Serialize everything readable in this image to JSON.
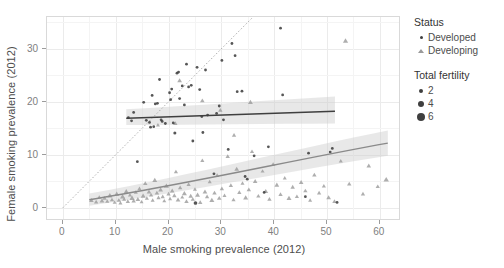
{
  "chart": {
    "type": "scatter",
    "title": "",
    "xlabel": "Male smoking prevalence (2012)",
    "ylabel": "Female smoking prevalence (2012)",
    "xlim": [
      -3,
      64
    ],
    "ylim": [
      -2.5,
      36
    ],
    "xticks": [
      0,
      10,
      20,
      30,
      40,
      50,
      60
    ],
    "yticks": [
      0,
      10,
      20,
      30
    ],
    "grid": true,
    "grid_color": "#ebebeb",
    "panel_bg": "#ffffff",
    "reference_line": {
      "name": "identity-line",
      "style": "dotted",
      "from": [
        0,
        0
      ],
      "to": [
        36,
        36
      ],
      "color": "#999999"
    }
  },
  "legend": {
    "position": "right",
    "status": {
      "title": "Status",
      "items": [
        {
          "label": "Developed",
          "color": "#3f3f3f",
          "shape": "circle"
        },
        {
          "label": "Developing",
          "color": "#9a9a9a",
          "shape": "triangle"
        }
      ]
    },
    "fertility": {
      "title": "Total fertility",
      "items": [
        {
          "label": "2",
          "size": 4
        },
        {
          "label": "4",
          "size": 6
        },
        {
          "label": "6",
          "size": 8
        }
      ]
    }
  },
  "chart_data": {
    "type": "scatter",
    "title": "",
    "xlabel": "Male smoking prevalence (2012)",
    "ylabel": "Female smoking prevalence (2012)",
    "xlim": [
      -3,
      64
    ],
    "ylim": [
      -2.5,
      36
    ],
    "xticks": [
      0,
      10,
      20,
      30,
      40,
      50,
      60
    ],
    "yticks": [
      0,
      10,
      20,
      30
    ],
    "grid": true,
    "legend_position": "right",
    "size_encoding": {
      "name": "Total fertility",
      "breaks": [
        2,
        4,
        6
      ]
    },
    "color_encoding": {
      "name": "Status",
      "levels": [
        "Developed",
        "Developing"
      ]
    },
    "series": [
      {
        "name": "Developed",
        "shape": "circle",
        "color": "#3f3f3f",
        "points": [
          {
            "x": 12.4,
            "y": 17.0,
            "s": 2.0
          },
          {
            "x": 13.0,
            "y": 16.4,
            "s": 2.0
          },
          {
            "x": 13.4,
            "y": 18.0,
            "s": 2.0
          },
          {
            "x": 14.1,
            "y": 8.7,
            "s": 2.0
          },
          {
            "x": 15.3,
            "y": 19.9,
            "s": 2.0
          },
          {
            "x": 15.8,
            "y": 16.5,
            "s": 2.2
          },
          {
            "x": 16.4,
            "y": 16.1,
            "s": 2.0
          },
          {
            "x": 16.6,
            "y": 15.2,
            "s": 2.0
          },
          {
            "x": 16.9,
            "y": 21.2,
            "s": 2.0
          },
          {
            "x": 17.2,
            "y": 15.3,
            "s": 2.0
          },
          {
            "x": 17.5,
            "y": 19.6,
            "s": 2.4
          },
          {
            "x": 17.9,
            "y": 19.7,
            "s": 2.4
          },
          {
            "x": 18.3,
            "y": 24.2,
            "s": 2.0
          },
          {
            "x": 18.6,
            "y": 16.6,
            "s": 2.0
          },
          {
            "x": 18.8,
            "y": 16.3,
            "s": 2.0
          },
          {
            "x": 19.4,
            "y": 15.9,
            "s": 2.0
          },
          {
            "x": 20.2,
            "y": 21.7,
            "s": 2.0
          },
          {
            "x": 20.4,
            "y": 20.4,
            "s": 2.0
          },
          {
            "x": 20.6,
            "y": 22.4,
            "s": 2.0
          },
          {
            "x": 20.9,
            "y": 16.0,
            "s": 2.0
          },
          {
            "x": 21.2,
            "y": 14.1,
            "s": 4.6
          },
          {
            "x": 21.6,
            "y": 25.4,
            "s": 2.0
          },
          {
            "x": 21.9,
            "y": 25.6,
            "s": 2.0
          },
          {
            "x": 22.1,
            "y": 20.6,
            "s": 2.0
          },
          {
            "x": 22.6,
            "y": 23.0,
            "s": 2.0
          },
          {
            "x": 23.0,
            "y": 19.4,
            "s": 2.0
          },
          {
            "x": 23.4,
            "y": 27.1,
            "s": 2.0
          },
          {
            "x": 23.8,
            "y": 22.8,
            "s": 2.0
          },
          {
            "x": 24.3,
            "y": 23.1,
            "s": 2.0
          },
          {
            "x": 24.6,
            "y": 12.6,
            "s": 2.0
          },
          {
            "x": 25.1,
            "y": 0.9,
            "s": 6.0
          },
          {
            "x": 25.4,
            "y": 26.5,
            "s": 2.0
          },
          {
            "x": 25.9,
            "y": 22.3,
            "s": 2.0
          },
          {
            "x": 26.3,
            "y": 17.2,
            "s": 2.0
          },
          {
            "x": 26.5,
            "y": 14.2,
            "s": 3.2
          },
          {
            "x": 27.0,
            "y": 26.0,
            "s": 2.0
          },
          {
            "x": 27.4,
            "y": 17.5,
            "s": 2.0
          },
          {
            "x": 28.6,
            "y": 6.4,
            "s": 2.6
          },
          {
            "x": 29.1,
            "y": 17.8,
            "s": 2.0
          },
          {
            "x": 29.6,
            "y": 19.2,
            "s": 2.0
          },
          {
            "x": 30.1,
            "y": 27.8,
            "s": 2.0
          },
          {
            "x": 30.4,
            "y": 16.6,
            "s": 2.0
          },
          {
            "x": 31.3,
            "y": 11.0,
            "s": 2.0
          },
          {
            "x": 32.0,
            "y": 31.0,
            "s": 2.0
          },
          {
            "x": 32.6,
            "y": 28.7,
            "s": 2.0
          },
          {
            "x": 33.0,
            "y": 21.9,
            "s": 2.0
          },
          {
            "x": 33.9,
            "y": 22.0,
            "s": 2.0
          },
          {
            "x": 34.5,
            "y": 5.9,
            "s": 2.0
          },
          {
            "x": 34.9,
            "y": 5.4,
            "s": 2.0
          },
          {
            "x": 36.2,
            "y": 9.8,
            "s": 2.0
          },
          {
            "x": 38.1,
            "y": 2.9,
            "s": 2.4
          },
          {
            "x": 38.9,
            "y": 11.5,
            "s": 2.0
          },
          {
            "x": 41.2,
            "y": 33.9,
            "s": 2.0
          },
          {
            "x": 41.6,
            "y": 21.3,
            "s": 2.0
          },
          {
            "x": 45.9,
            "y": 2.1,
            "s": 2.6
          },
          {
            "x": 46.5,
            "y": 10.3,
            "s": 2.0
          },
          {
            "x": 50.6,
            "y": 10.5,
            "s": 2.2
          },
          {
            "x": 51.0,
            "y": 11.2,
            "s": 2.0
          },
          {
            "x": 51.9,
            "y": 1.0,
            "s": 2.0
          }
        ]
      },
      {
        "name": "Developing",
        "shape": "triangle",
        "color": "#9a9a9a",
        "points": [
          {
            "x": 5.4,
            "y": 1.4,
            "s": 4.4
          },
          {
            "x": 6.3,
            "y": 1.1,
            "s": 4.0
          },
          {
            "x": 6.9,
            "y": 2.0,
            "s": 3.6
          },
          {
            "x": 7.4,
            "y": 1.3,
            "s": 4.8
          },
          {
            "x": 7.9,
            "y": 1.8,
            "s": 4.2
          },
          {
            "x": 8.4,
            "y": 1.2,
            "s": 3.8
          },
          {
            "x": 8.9,
            "y": 2.3,
            "s": 5.2
          },
          {
            "x": 9.3,
            "y": 1.5,
            "s": 4.0
          },
          {
            "x": 9.8,
            "y": 1.0,
            "s": 3.4
          },
          {
            "x": 10.2,
            "y": 2.6,
            "s": 4.6
          },
          {
            "x": 10.6,
            "y": 1.4,
            "s": 4.0
          },
          {
            "x": 10.9,
            "y": 0.9,
            "s": 3.6
          },
          {
            "x": 11.3,
            "y": 2.1,
            "s": 5.0
          },
          {
            "x": 11.6,
            "y": 1.6,
            "s": 3.8
          },
          {
            "x": 12.0,
            "y": 3.1,
            "s": 4.4
          },
          {
            "x": 12.3,
            "y": 1.2,
            "s": 4.0
          },
          {
            "x": 12.7,
            "y": 2.4,
            "s": 3.6
          },
          {
            "x": 13.1,
            "y": 1.8,
            "s": 5.4
          },
          {
            "x": 13.4,
            "y": 1.3,
            "s": 4.2
          },
          {
            "x": 13.8,
            "y": 2.9,
            "s": 3.8
          },
          {
            "x": 14.2,
            "y": 1.6,
            "s": 4.6
          },
          {
            "x": 14.5,
            "y": 3.6,
            "s": 4.0
          },
          {
            "x": 14.9,
            "y": 1.1,
            "s": 3.4
          },
          {
            "x": 15.2,
            "y": 2.2,
            "s": 5.0
          },
          {
            "x": 15.6,
            "y": 4.6,
            "s": 4.2
          },
          {
            "x": 15.9,
            "y": 1.8,
            "s": 3.8
          },
          {
            "x": 16.3,
            "y": 3.0,
            "s": 4.4
          },
          {
            "x": 16.7,
            "y": 2.4,
            "s": 4.0
          },
          {
            "x": 17.0,
            "y": 1.4,
            "s": 3.6
          },
          {
            "x": 17.4,
            "y": 5.2,
            "s": 4.8
          },
          {
            "x": 17.8,
            "y": 2.8,
            "s": 4.2
          },
          {
            "x": 18.1,
            "y": 1.9,
            "s": 3.8
          },
          {
            "x": 18.5,
            "y": 3.4,
            "s": 4.6
          },
          {
            "x": 18.9,
            "y": 2.1,
            "s": 4.0
          },
          {
            "x": 19.2,
            "y": 1.3,
            "s": 3.4
          },
          {
            "x": 19.6,
            "y": 4.1,
            "s": 5.2
          },
          {
            "x": 20.0,
            "y": 2.6,
            "s": 4.0
          },
          {
            "x": 20.3,
            "y": 1.7,
            "s": 3.6
          },
          {
            "x": 20.7,
            "y": 3.2,
            "s": 4.4
          },
          {
            "x": 21.1,
            "y": 2.3,
            "s": 4.2
          },
          {
            "x": 21.4,
            "y": 6.8,
            "s": 3.8
          },
          {
            "x": 21.8,
            "y": 1.5,
            "s": 4.6
          },
          {
            "x": 22.2,
            "y": 3.8,
            "s": 4.0
          },
          {
            "x": 22.6,
            "y": 2.0,
            "s": 3.4
          },
          {
            "x": 23.0,
            "y": 2.7,
            "s": 5.0
          },
          {
            "x": 23.4,
            "y": 1.2,
            "s": 4.2
          },
          {
            "x": 23.8,
            "y": 4.4,
            "s": 3.8
          },
          {
            "x": 24.2,
            "y": 2.2,
            "s": 4.4
          },
          {
            "x": 24.6,
            "y": 1.6,
            "s": 4.0
          },
          {
            "x": 25.0,
            "y": 3.5,
            "s": 3.6
          },
          {
            "x": 25.5,
            "y": 2.4,
            "s": 4.8
          },
          {
            "x": 26.0,
            "y": 1.0,
            "s": 4.2
          },
          {
            "x": 26.4,
            "y": 8.9,
            "s": 3.8
          },
          {
            "x": 26.9,
            "y": 3.0,
            "s": 4.6
          },
          {
            "x": 27.3,
            "y": 2.1,
            "s": 4.0
          },
          {
            "x": 27.8,
            "y": 4.9,
            "s": 3.4
          },
          {
            "x": 28.2,
            "y": 1.4,
            "s": 5.0
          },
          {
            "x": 28.7,
            "y": 2.8,
            "s": 4.2
          },
          {
            "x": 29.2,
            "y": 6.1,
            "s": 3.8
          },
          {
            "x": 29.6,
            "y": 1.8,
            "s": 4.4
          },
          {
            "x": 30.1,
            "y": 3.6,
            "s": 4.0
          },
          {
            "x": 30.6,
            "y": 2.3,
            "s": 3.6
          },
          {
            "x": 31.2,
            "y": 9.7,
            "s": 4.2
          },
          {
            "x": 31.8,
            "y": 4.2,
            "s": 4.0
          },
          {
            "x": 32.3,
            "y": 1.5,
            "s": 3.8
          },
          {
            "x": 32.9,
            "y": 7.3,
            "s": 4.6
          },
          {
            "x": 33.4,
            "y": 2.9,
            "s": 4.0
          },
          {
            "x": 34.0,
            "y": 4.6,
            "s": 3.6
          },
          {
            "x": 34.6,
            "y": 1.9,
            "s": 5.0
          },
          {
            "x": 35.2,
            "y": 3.4,
            "s": 4.2
          },
          {
            "x": 35.8,
            "y": 10.6,
            "s": 3.8
          },
          {
            "x": 36.4,
            "y": 5.0,
            "s": 4.4
          },
          {
            "x": 37.0,
            "y": 2.2,
            "s": 4.0
          },
          {
            "x": 37.8,
            "y": 6.9,
            "s": 3.6
          },
          {
            "x": 38.4,
            "y": 3.1,
            "s": 4.8
          },
          {
            "x": 39.1,
            "y": 1.6,
            "s": 4.2
          },
          {
            "x": 39.8,
            "y": 8.2,
            "s": 3.8
          },
          {
            "x": 40.5,
            "y": 4.3,
            "s": 4.6
          },
          {
            "x": 41.2,
            "y": 2.5,
            "s": 4.0
          },
          {
            "x": 42.0,
            "y": 5.6,
            "s": 3.4
          },
          {
            "x": 42.8,
            "y": 1.8,
            "s": 5.0
          },
          {
            "x": 43.5,
            "y": 3.9,
            "s": 4.2
          },
          {
            "x": 44.3,
            "y": 2.1,
            "s": 3.8
          },
          {
            "x": 45.1,
            "y": 4.8,
            "s": 4.4
          },
          {
            "x": 45.9,
            "y": 3.2,
            "s": 4.0
          },
          {
            "x": 46.8,
            "y": 1.4,
            "s": 3.6
          },
          {
            "x": 47.6,
            "y": 6.2,
            "s": 4.2
          },
          {
            "x": 48.5,
            "y": 2.8,
            "s": 4.0
          },
          {
            "x": 49.4,
            "y": 4.1,
            "s": 3.8
          },
          {
            "x": 50.3,
            "y": 1.9,
            "s": 4.6
          },
          {
            "x": 51.4,
            "y": 1.2,
            "s": 4.0
          },
          {
            "x": 52.6,
            "y": 8.8,
            "s": 3.6
          },
          {
            "x": 53.5,
            "y": 31.5,
            "s": 5.2
          },
          {
            "x": 54.2,
            "y": 4.5,
            "s": 4.2
          },
          {
            "x": 56.8,
            "y": 2.6,
            "s": 4.0
          },
          {
            "x": 57.9,
            "y": 7.9,
            "s": 4.4
          },
          {
            "x": 59.6,
            "y": 4.0,
            "s": 4.0
          },
          {
            "x": 61.2,
            "y": 5.3,
            "s": 5.6
          },
          {
            "x": 22.1,
            "y": 24.0,
            "s": 4.6
          },
          {
            "x": 26.4,
            "y": 20.2,
            "s": 4.4
          },
          {
            "x": 29.8,
            "y": 18.4,
            "s": 4.2
          },
          {
            "x": 21.3,
            "y": 15.9,
            "s": 4.0
          },
          {
            "x": 18.0,
            "y": 15.6,
            "s": 3.6
          },
          {
            "x": 35.5,
            "y": 19.9,
            "s": 4.8
          },
          {
            "x": 32.4,
            "y": 13.7,
            "s": 4.0
          }
        ]
      }
    ],
    "fits": [
      {
        "name": "Developed",
        "color": "#3f3f3f",
        "band_color": "#cccccc",
        "x_start": 12.0,
        "x_end": 51.5,
        "y_start": 16.9,
        "y_end": 18.2,
        "band_start": [
          15.6,
          18.6
        ],
        "band_end": [
          15.9,
          21.0
        ]
      },
      {
        "name": "Developing",
        "color": "#8a8a8a",
        "band_color": "#cccccc",
        "x_start": 5.0,
        "x_end": 61.5,
        "y_start": 1.5,
        "y_end": 12.2,
        "band_start": [
          0.4,
          2.7
        ],
        "band_end": [
          9.8,
          14.6
        ]
      }
    ]
  }
}
